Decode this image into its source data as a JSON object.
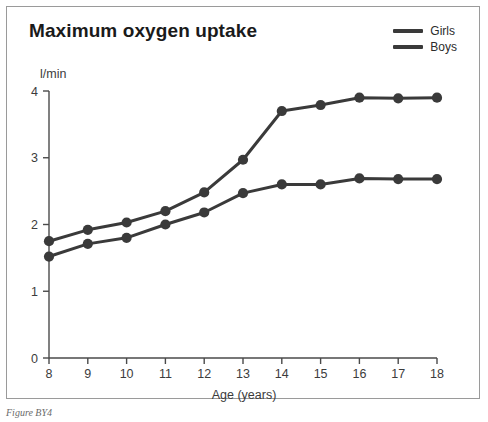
{
  "figure": {
    "title": "Maximum oxygen uptake",
    "caption": "Figure BY4"
  },
  "legend": {
    "position": "top-right",
    "entries": [
      {
        "label": "Girls",
        "color": "#3a3a3a"
      },
      {
        "label": "Boys",
        "color": "#3a3a3a"
      }
    ]
  },
  "axes": {
    "y_unit": "l/min",
    "x_title": "Age (years)",
    "y_ticks": [
      "0",
      "1",
      "2",
      "3",
      "4"
    ],
    "x_ticks": [
      "8",
      "9",
      "10",
      "11",
      "12",
      "13",
      "14",
      "15",
      "16",
      "17",
      "18"
    ]
  },
  "chart_data": {
    "type": "line",
    "title": "Maximum oxygen uptake",
    "xlabel": "Age (years)",
    "ylabel": "l/min",
    "xlim": [
      8,
      18
    ],
    "ylim": [
      0,
      4
    ],
    "grid": false,
    "legend_position": "top-right",
    "x": [
      8,
      9,
      10,
      11,
      12,
      13,
      14,
      15,
      16,
      17,
      18
    ],
    "series": [
      {
        "name": "Girls",
        "color": "#3a3a3a",
        "values": [
          1.75,
          1.92,
          2.03,
          2.2,
          2.48,
          2.97,
          3.7,
          3.79,
          3.9,
          3.89,
          3.9
        ]
      },
      {
        "name": "Boys",
        "color": "#3a3a3a",
        "values": [
          1.52,
          1.71,
          1.8,
          2.0,
          2.18,
          2.47,
          2.6,
          2.6,
          2.69,
          2.68,
          2.68
        ]
      }
    ]
  }
}
